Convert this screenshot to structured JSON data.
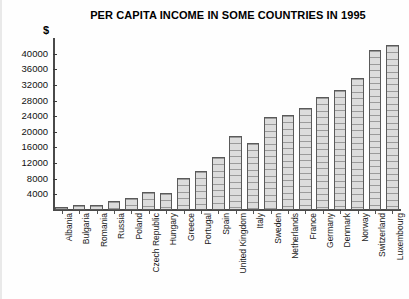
{
  "chart_data": {
    "type": "bar",
    "title": "PER CAPITA INCOME IN SOME COUNTRIES IN 1995",
    "xlabel": "",
    "ylabel": "$",
    "ylim": [
      0,
      44000
    ],
    "ytick_step": 4000,
    "yticks": [
      4000,
      8000,
      12000,
      16000,
      20000,
      24000,
      28000,
      32000,
      36000,
      40000
    ],
    "ytick_labels": [
      "4000",
      "8000",
      "12000",
      "16000",
      "20000",
      "24000",
      "28000",
      "32000",
      "36000",
      "40000"
    ],
    "grid": false,
    "legend": null,
    "categories": [
      "Albania",
      "Bulgaria",
      "Romania",
      "Russia",
      "Poland",
      "Czech Republic",
      "Hungary",
      "Greece",
      "Portugal",
      "Spain",
      "United Kingdom",
      "Italy",
      "Sweden",
      "Netherlands",
      "France",
      "Germany",
      "Denmark",
      "Norway",
      "Switzerland",
      "Luxembourg"
    ],
    "values": [
      800,
      1200,
      1400,
      2200,
      3000,
      4500,
      4400,
      8200,
      10000,
      13600,
      19000,
      17200,
      23800,
      24400,
      26000,
      29000,
      30600,
      33800,
      41000,
      42200
    ],
    "bar_fill_color": "#dcdcdc",
    "bar_hatch_color": "#9a9a9a",
    "bar_edge_color": "#5a5a5a",
    "axis_color": "#4a4a4a",
    "text_color": "#000000"
  }
}
